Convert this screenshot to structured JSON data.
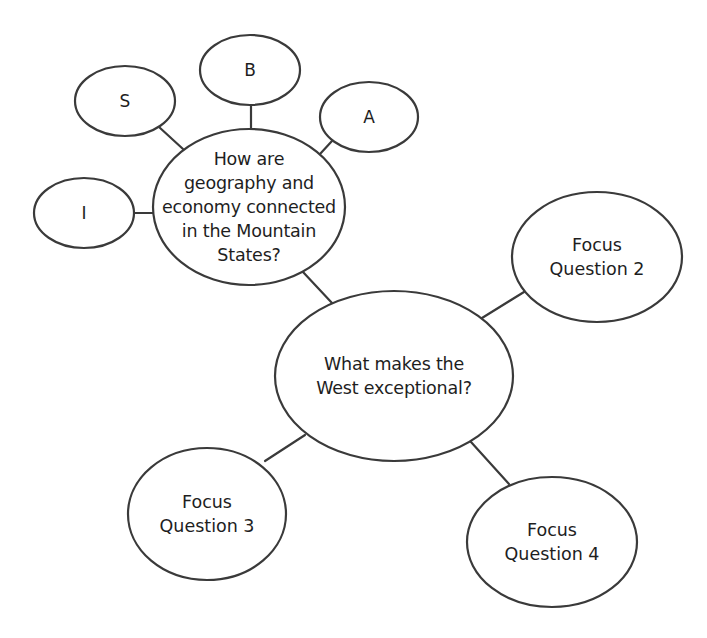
{
  "diagram": {
    "type": "web-organizer",
    "stroke_color": "#3a3a3a",
    "fill_color": "#ffffff",
    "text_color": "#1e1e1e",
    "central": {
      "id": "central",
      "label": "What makes the\nWest exceptional?",
      "cx": 394,
      "cy": 376,
      "rx": 119,
      "ry": 85
    },
    "focus_questions": [
      {
        "id": "fq1",
        "label": "How are\ngeography and\neconomy connected\nin the Mountain\nStates?",
        "cx": 249,
        "cy": 207,
        "rx": 96,
        "ry": 78
      },
      {
        "id": "fq2",
        "label": "Focus\nQuestion 2",
        "cx": 597,
        "cy": 257,
        "rx": 85,
        "ry": 65
      },
      {
        "id": "fq3",
        "label": "Focus\nQuestion 3",
        "cx": 207,
        "cy": 514,
        "rx": 79,
        "ry": 66
      },
      {
        "id": "fq4",
        "label": "Focus\nQuestion 4",
        "cx": 552,
        "cy": 542,
        "rx": 85,
        "ry": 65
      }
    ],
    "sub_nodes": [
      {
        "id": "s",
        "label": "S",
        "cx": 125,
        "cy": 101,
        "rx": 50,
        "ry": 35
      },
      {
        "id": "b",
        "label": "B",
        "cx": 250,
        "cy": 70,
        "rx": 50,
        "ry": 35
      },
      {
        "id": "a",
        "label": "A",
        "cx": 369,
        "cy": 117,
        "rx": 49,
        "ry": 35
      },
      {
        "id": "i",
        "label": "I",
        "cx": 84,
        "cy": 213,
        "rx": 50,
        "ry": 35
      }
    ],
    "connectors": [
      {
        "from": "s",
        "to": "fq1",
        "x1": 159,
        "y1": 127,
        "x2": 183,
        "y2": 149
      },
      {
        "from": "b",
        "to": "fq1",
        "x1": 251,
        "y1": 105,
        "x2": 251,
        "y2": 130
      },
      {
        "from": "a",
        "to": "fq1",
        "x1": 332,
        "y1": 141,
        "x2": 320,
        "y2": 154
      },
      {
        "from": "i",
        "to": "fq1",
        "x1": 134,
        "y1": 213,
        "x2": 154,
        "y2": 213
      },
      {
        "from": "fq1",
        "to": "central",
        "x1": 303,
        "y1": 272,
        "x2": 332,
        "y2": 303
      },
      {
        "from": "central",
        "to": "fq2",
        "x1": 482,
        "y1": 318,
        "x2": 524,
        "y2": 292
      },
      {
        "from": "central",
        "to": "fq3",
        "x1": 305,
        "y1": 435,
        "x2": 265,
        "y2": 461
      },
      {
        "from": "central",
        "to": "fq4",
        "x1": 471,
        "y1": 442,
        "x2": 509,
        "y2": 484
      }
    ]
  }
}
